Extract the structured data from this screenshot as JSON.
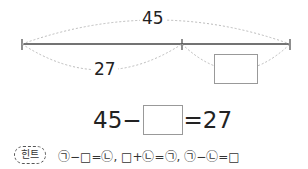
{
  "diagram": {
    "total_label": "45",
    "part_label": "27",
    "unknown_box": ""
  },
  "equation": {
    "left": "45−",
    "box": "",
    "right": "=27"
  },
  "hint": {
    "badge": "힌트",
    "text": "㉠−□=㉡, □+㉡=㉠, ㉠−㉡=□"
  }
}
